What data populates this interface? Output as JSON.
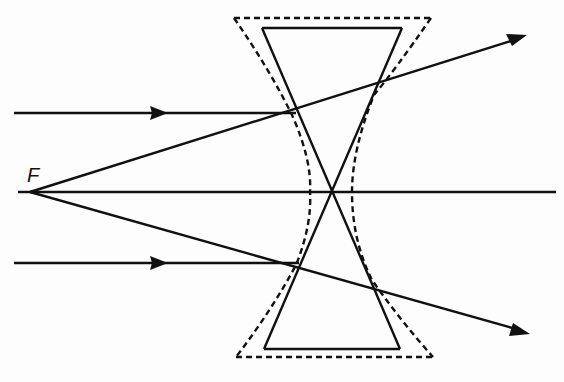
{
  "diagram": {
    "labels": {
      "focal_point": "F"
    },
    "colors": {
      "stroke": "#111111",
      "background": "#fdfdfd"
    },
    "focal_point": {
      "x": 30,
      "y": 192
    },
    "optical_axis": {
      "x1": 18,
      "x2": 556,
      "y": 192
    },
    "lens_solid": {
      "top": {
        "x1": 262,
        "x2": 402,
        "y": 28
      },
      "bottom": {
        "x1": 262,
        "x2": 402,
        "y": 349
      },
      "crossing": {
        "x": 331,
        "y": 192
      }
    },
    "lens_dashed": {
      "top": {
        "x1": 234,
        "x2": 431,
        "y": 18
      },
      "bottom": {
        "x1": 236,
        "x2": 433,
        "y": 357
      }
    },
    "rays": [
      {
        "name": "upper-incident-ray",
        "from": [
          14,
          113
        ],
        "to": [
          296,
          113
        ],
        "arrow_at": [
          160,
          113
        ]
      },
      {
        "name": "upper-refracted-ray",
        "from": [
          30,
          192
        ],
        "to": [
          525,
          36
        ]
      },
      {
        "name": "lower-incident-ray",
        "from": [
          14,
          263
        ],
        "to": [
          299,
          263
        ],
        "arrow_at": [
          160,
          263
        ]
      },
      {
        "name": "lower-refracted-ray",
        "from": [
          30,
          192
        ],
        "to": [
          528,
          333
        ]
      }
    ]
  }
}
